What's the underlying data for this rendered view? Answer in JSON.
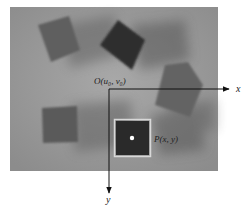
{
  "figure": {
    "origin_label": "O(u₀, v₀)",
    "point_label": "P(x, y)",
    "x_axis_label": "x",
    "y_axis_label": "y",
    "colors": {
      "background": "#9a9a9a",
      "cube_light": "#5e5e5e",
      "cube_dark": "#2e2e2e",
      "highlight_box": "#d8d8d8",
      "target_point": "#ffffff",
      "axis": "#111111"
    },
    "objects": [
      {
        "name": "cube-top-left",
        "shade": "medium"
      },
      {
        "name": "cube-top-center",
        "shade": "dark"
      },
      {
        "name": "cube-right",
        "shade": "medium"
      },
      {
        "name": "cube-bottom-left",
        "shade": "medium"
      },
      {
        "name": "cube-target",
        "shade": "dark",
        "highlighted": true
      }
    ]
  }
}
